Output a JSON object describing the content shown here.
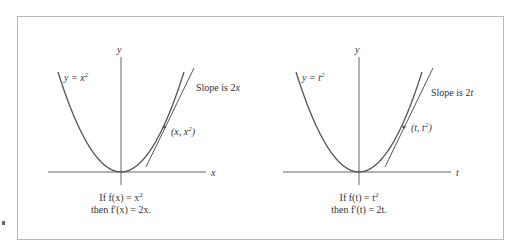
{
  "figure": {
    "stroke_color": "#555555",
    "frame_color": "#b8b8b8",
    "panels": [
      {
        "id": "left",
        "axis_labels": {
          "vertical": "y",
          "horizontal": "x"
        },
        "curve_label": {
          "lhs": "y = x",
          "exp": "2"
        },
        "point_label": {
          "pre": "(x, x",
          "exp": "2",
          "post": ")"
        },
        "slope_label": {
          "text": "Slope is 2",
          "var": "x"
        },
        "caption": {
          "line1": {
            "pre": "If f(x) = x",
            "exp": "2"
          },
          "line2": "then f′(x) = 2x."
        }
      },
      {
        "id": "right",
        "axis_labels": {
          "vertical": "y",
          "horizontal": "t"
        },
        "curve_label": {
          "lhs": "y = t",
          "exp": "2"
        },
        "point_label": {
          "pre": "(t, t",
          "exp": "2",
          "post": ")"
        },
        "slope_label": {
          "text": "Slope is 2",
          "var": "t"
        },
        "caption": {
          "line1": {
            "pre": "If f(t) = t",
            "exp": "2"
          },
          "line2": "then f′(t) = 2t."
        }
      }
    ]
  }
}
